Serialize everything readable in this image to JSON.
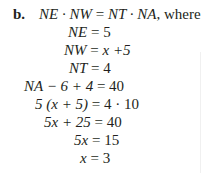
{
  "problem": {
    "label": "b.",
    "lines": [
      {
        "lhs": "NE · NW",
        "op": "=",
        "rhs": "NT · NA",
        "suffix": ", where"
      },
      {
        "lhs": "NE",
        "op": "=",
        "rhs": "5"
      },
      {
        "lhs": "NW",
        "op": "=",
        "rhs": "x +5"
      },
      {
        "lhs": "NT",
        "op": "=",
        "rhs": "4"
      },
      {
        "lhs": "NA − 6 + 4",
        "op": "=",
        "rhs": "40"
      },
      {
        "lhs": "5 (x + 5)",
        "op": "=",
        "rhs": "4 · 10"
      },
      {
        "lhs": "5x + 25",
        "op": "=",
        "rhs": "40"
      },
      {
        "lhs": "5x",
        "op": "=",
        "rhs": "15"
      },
      {
        "lhs": "x",
        "op": "=",
        "rhs": "3"
      }
    ]
  }
}
